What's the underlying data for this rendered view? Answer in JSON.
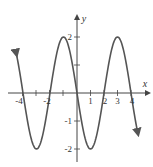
{
  "chart_data": {
    "type": "line",
    "title": "",
    "xlabel": "x",
    "ylabel": "y",
    "function": "y = -2 sin(pi x / 2)",
    "x_ticks": [
      -4,
      -3,
      -2,
      -1,
      1,
      2,
      3,
      4
    ],
    "x_tick_labels": [
      "-4",
      "",
      "-2",
      "",
      "1",
      "2",
      "3",
      "4"
    ],
    "y_ticks": [
      -2,
      -1,
      1,
      2
    ],
    "y_tick_labels": [
      "-2",
      "-1",
      "",
      "2"
    ],
    "xlim": [
      -4.6,
      4.6
    ],
    "ylim": [
      -2.3,
      2.3
    ],
    "grid": false,
    "legend": null,
    "series": [
      {
        "name": "curve",
        "x": [
          -4.5,
          -4,
          -3,
          -2,
          -1,
          0,
          1,
          2,
          3,
          4,
          4.5
        ],
        "y": [
          1.41,
          0,
          -2,
          0,
          2,
          0,
          -2,
          0,
          2,
          0,
          -1.41
        ]
      }
    ],
    "color": "#555555"
  },
  "labels": {
    "x_axis": "x",
    "y_axis": "y",
    "xt_m4": "-4",
    "xt_m2": "-2",
    "xt_1": "1",
    "xt_2": "2",
    "xt_3": "3",
    "xt_4": "4",
    "yt_2": "2",
    "yt_m1": "-1",
    "yt_m2": "-2"
  }
}
